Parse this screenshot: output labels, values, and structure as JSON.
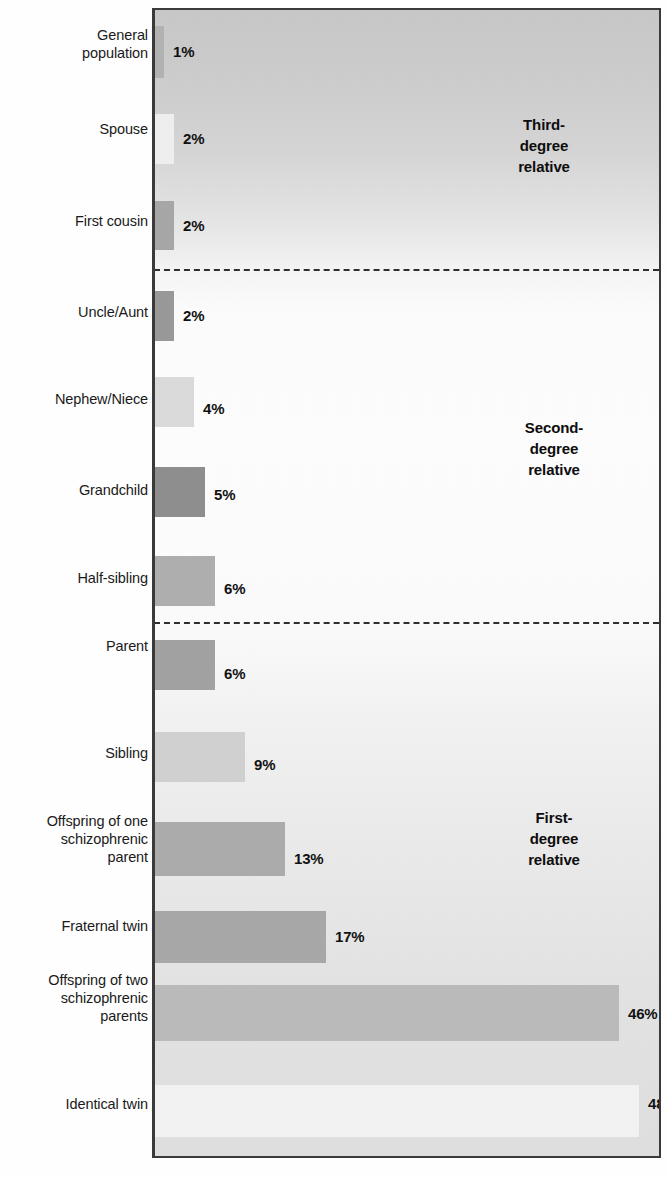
{
  "chart_data": {
    "type": "bar",
    "orientation": "horizontal",
    "title": "",
    "subtitle": "",
    "xlabel": "",
    "ylabel": "",
    "xlim": [
      0,
      50
    ],
    "grid": false,
    "legend": null,
    "categories": [
      "General\npopulation",
      "Spouse",
      "First cousin",
      "Uncle/Aunt",
      "Nephew/Niece",
      "Grandchild",
      "Half-sibling",
      "Parent",
      "Sibling",
      "Offspring of one\nschizophrenic\nparent",
      "Fraternal twin",
      "Offspring of two\nschizophrenic\nparents",
      "Identical twin"
    ],
    "values": [
      1,
      2,
      2,
      2,
      4,
      5,
      6,
      6,
      9,
      13,
      17,
      46,
      48
    ],
    "value_labels": [
      "1%",
      "2%",
      "2%",
      "2%",
      "4%",
      "5%",
      "6%",
      "6%",
      "9%",
      "13%",
      "17%",
      "46%",
      "48%"
    ],
    "bar_colors": [
      "#b4b4b4",
      "#f0f0f0",
      "#a8a8a8",
      "#9a9a9a",
      "#dcdcdc",
      "#8f8f8f",
      "#b0b0b0",
      "#a3a3a3",
      "#d2d2d2",
      "#adadad",
      "#a9a9a9",
      "#bcbcbc",
      "#f4f4f4"
    ],
    "annotations": [
      {
        "text": "Third-\ndegree\nrelative",
        "group": "third-degree"
      },
      {
        "text": "Second-\ndegree\nrelative",
        "group": "second-degree"
      },
      {
        "text": "First-\ndegree\nrelative",
        "group": "first-degree"
      }
    ],
    "group_dividers": [
      {
        "after_category": "First cousin"
      },
      {
        "after_category": "Half-sibling"
      }
    ]
  },
  "figure": {
    "frame_color": "#3a3a3a",
    "text_color": "#1a1a1a",
    "background": "#ffffff"
  }
}
